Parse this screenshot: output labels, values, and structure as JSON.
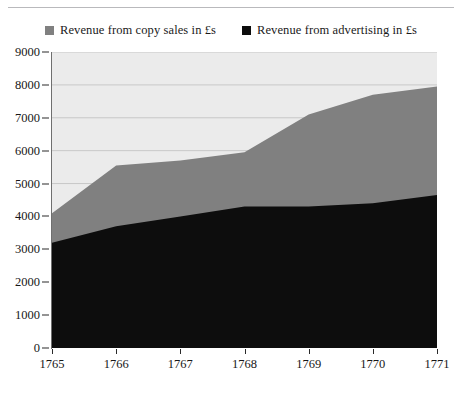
{
  "chart_data": {
    "type": "area",
    "stacked": true,
    "title": "",
    "subtitle": "",
    "xlabel": "",
    "ylabel": "",
    "categories": [
      "1765",
      "1766",
      "1767",
      "1768",
      "1769",
      "1770",
      "1771"
    ],
    "x": [
      1765,
      1766,
      1767,
      1768,
      1769,
      1770,
      1771
    ],
    "series": [
      {
        "name": "Revenue from advertising in £s",
        "color": "#0d0d0d",
        "values": [
          3200,
          3700,
          4000,
          4300,
          4300,
          4400,
          4650
        ]
      },
      {
        "name": "Revenue from copy sales in £s",
        "color": "#808080",
        "values": [
          900,
          1850,
          1700,
          1650,
          2800,
          3300,
          3300
        ]
      }
    ],
    "cumulative_totals": [
      4100,
      5550,
      5700,
      5950,
      7100,
      7700,
      7950
    ],
    "ylim": [
      0,
      9000
    ],
    "yticks": [
      0,
      1000,
      2000,
      3000,
      4000,
      5000,
      6000,
      7000,
      8000,
      9000
    ],
    "ytick_labels": [
      "0",
      "1000",
      "2000",
      "3000",
      "4000",
      "5000",
      "6000",
      "7000",
      "8000",
      "9000"
    ],
    "grid": true,
    "grid_color": "#c8c8c8",
    "plot_background": "#ebebeb",
    "legend_position": "top"
  },
  "legend": {
    "items": [
      {
        "label": "Revenue from copy sales in £s",
        "color": "#808080",
        "swatch_icon": "square-marker-icon"
      },
      {
        "label": "Revenue from advertising in £s",
        "color": "#0d0d0d",
        "swatch_icon": "square-marker-icon"
      }
    ]
  }
}
